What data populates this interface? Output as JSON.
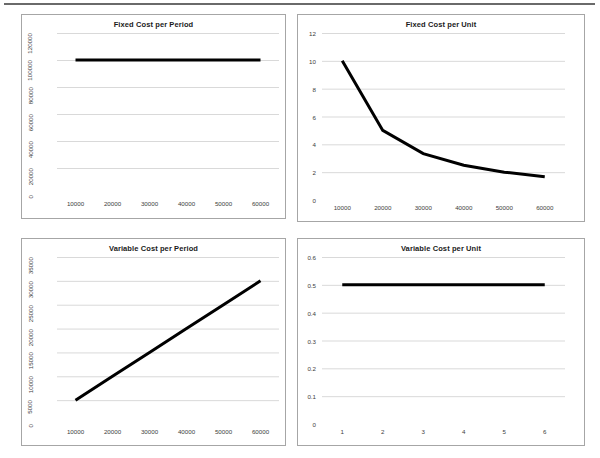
{
  "page": {
    "background_color": "#ffffff",
    "rule_color": "#6a6a6a",
    "axis_text_color": "#3d3d3d",
    "title_color": "#1a1a1a",
    "gridline_color": "#d9d9d9",
    "series_color": "#000000",
    "border_color": "#a6a6a6"
  },
  "chart_data": [
    {
      "id": "fixed-cost-per-period",
      "type": "line",
      "title": "Fixed Cost per Period",
      "xlabel": "",
      "ylabel": "",
      "x": [
        10000,
        20000,
        30000,
        40000,
        50000,
        60000
      ],
      "values": [
        100000,
        100000,
        100000,
        100000,
        100000,
        100000
      ],
      "xtick_labels": [
        "10000",
        "20000",
        "30000",
        "40000",
        "50000",
        "60000"
      ],
      "ytick_labels": [
        "0",
        "20000",
        "40000",
        "60000",
        "80000",
        "100000",
        "120000"
      ],
      "ytick_values": [
        0,
        20000,
        40000,
        60000,
        80000,
        100000,
        120000
      ],
      "xlim": [
        5000,
        65000
      ],
      "ylim": [
        0,
        120000
      ],
      "grid": true,
      "legend": "none",
      "ylabel_rotated": true
    },
    {
      "id": "fixed-cost-per-unit",
      "type": "line",
      "title": "Fixed Cost per Unit",
      "xlabel": "",
      "ylabel": "",
      "x": [
        10000,
        20000,
        30000,
        40000,
        50000,
        60000
      ],
      "values": [
        10,
        5,
        3.33,
        2.5,
        2,
        1.67
      ],
      "xtick_labels": [
        "10000",
        "20000",
        "30000",
        "40000",
        "50000",
        "60000"
      ],
      "ytick_labels": [
        "0",
        "2",
        "4",
        "6",
        "8",
        "10",
        "12"
      ],
      "ytick_values": [
        0,
        2,
        4,
        6,
        8,
        10,
        12
      ],
      "xlim": [
        5000,
        65000
      ],
      "ylim": [
        0,
        12
      ],
      "grid": true,
      "legend": "none",
      "ylabel_rotated": false
    },
    {
      "id": "variable-cost-per-period",
      "type": "line",
      "title": "Variable Cost per Period",
      "xlabel": "",
      "ylabel": "",
      "x": [
        10000,
        20000,
        30000,
        40000,
        50000,
        60000
      ],
      "values": [
        5000,
        10000,
        15000,
        20000,
        25000,
        30000
      ],
      "xtick_labels": [
        "10000",
        "20000",
        "30000",
        "40000",
        "50000",
        "60000"
      ],
      "ytick_labels": [
        "0",
        "5000",
        "10000",
        "15000",
        "20000",
        "25000",
        "30000",
        "35000"
      ],
      "ytick_values": [
        0,
        5000,
        10000,
        15000,
        20000,
        25000,
        30000,
        35000
      ],
      "xlim": [
        5000,
        65000
      ],
      "ylim": [
        0,
        35000
      ],
      "grid": true,
      "legend": "none",
      "ylabel_rotated": true
    },
    {
      "id": "variable-cost-per-unit",
      "type": "line",
      "title": "Variable Cost per Unit",
      "xlabel": "",
      "ylabel": "",
      "x": [
        1,
        2,
        3,
        4,
        5,
        6
      ],
      "values": [
        0.5,
        0.5,
        0.5,
        0.5,
        0.5,
        0.5
      ],
      "xtick_labels": [
        "1",
        "2",
        "3",
        "4",
        "5",
        "6"
      ],
      "ytick_labels": [
        "0",
        "0.1",
        "0.2",
        "0.3",
        "0.4",
        "0.5",
        "0.6"
      ],
      "ytick_values": [
        0,
        0.1,
        0.2,
        0.3,
        0.4,
        0.5,
        0.6
      ],
      "xlim": [
        0.5,
        6.5
      ],
      "ylim": [
        0,
        0.6
      ],
      "grid": true,
      "legend": "none",
      "ylabel_rotated": false
    }
  ]
}
